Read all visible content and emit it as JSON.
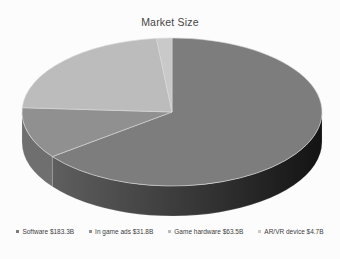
{
  "page": {
    "background": "#fcfcfc"
  },
  "chart_data": {
    "type": "pie",
    "style": "3d",
    "title": "Market Size",
    "categories": [
      "Software",
      "In game ads",
      "Game hardware",
      "AR/VR device"
    ],
    "values": [
      183.3,
      31.8,
      63.5,
      4.7
    ],
    "legend": [
      {
        "label": "Software $183.3B",
        "color": "#7d7d7d"
      },
      {
        "label": "In game ads $31.8B",
        "color": "#909090"
      },
      {
        "label": "Game hardware $63.5B",
        "color": "#bcbcbc"
      },
      {
        "label": "AR/VR device $4.7B",
        "color": "#c9c9c9"
      }
    ],
    "legend_position": "bottom",
    "start_angle_deg": 0,
    "direction": "clockwise",
    "colors": {
      "tops": [
        "#7d7d7d",
        "#909090",
        "#bcbcbc",
        "#c9c9c9"
      ],
      "side_software_gradient": [
        "#5f5f5f",
        "#131313"
      ],
      "side_in_game_ads": "#6f6f6f",
      "slice_border": "#d9d9d9",
      "title_color": "#464646",
      "legend_text_color": "#3c3c3c"
    }
  }
}
